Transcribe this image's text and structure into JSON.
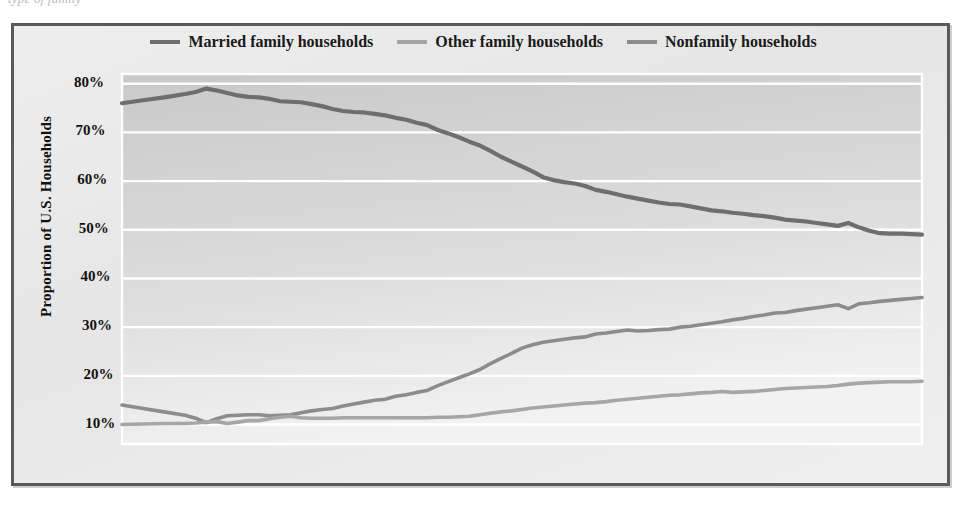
{
  "caption_remnant": "type of family",
  "figure": {
    "plot_bg_light": "#e9e9e9",
    "plot_bg_dark": "#c9c9c9",
    "gridline_color": "#ffffff",
    "frame_color": "#5a5a5a"
  },
  "legend": {
    "position": "top-center",
    "items": [
      {
        "label": "Married family households",
        "color": "#6e6e6e"
      },
      {
        "label": "Other family households",
        "color": "#a6a6a6"
      },
      {
        "label": "Nonfamily households",
        "color": "#8c8c8c"
      }
    ]
  },
  "axes": {
    "ylabel": "Proportion of U.S. Households",
    "xlabel": "",
    "yticks": [
      "10%",
      "20%",
      "30%",
      "40%",
      "50%",
      "60%",
      "70%",
      "80%"
    ],
    "xticks": [
      "1940",
      "1950",
      "1960",
      "1970",
      "1980",
      "1990",
      "2000",
      "2010"
    ]
  },
  "chart_data": {
    "type": "line",
    "title": "",
    "xlabel": "",
    "ylabel": "Proportion of U.S. Households",
    "xlim": [
      1940,
      2016
    ],
    "ylim": [
      6,
      82
    ],
    "grid": "horizontal",
    "legend_position": "top-center",
    "x": [
      1940,
      1942,
      1944,
      1946,
      1947,
      1948,
      1949,
      1950,
      1951,
      1952,
      1953,
      1954,
      1955,
      1956,
      1957,
      1958,
      1959,
      1960,
      1961,
      1962,
      1963,
      1964,
      1965,
      1966,
      1967,
      1968,
      1969,
      1970,
      1971,
      1972,
      1973,
      1974,
      1975,
      1976,
      1977,
      1978,
      1979,
      1980,
      1981,
      1982,
      1983,
      1984,
      1985,
      1986,
      1987,
      1988,
      1989,
      1990,
      1991,
      1992,
      1993,
      1994,
      1995,
      1996,
      1997,
      1998,
      1999,
      2000,
      2001,
      2002,
      2003,
      2004,
      2005,
      2006,
      2007,
      2008,
      2009,
      2010,
      2011,
      2012,
      2013,
      2014,
      2015,
      2016
    ],
    "series": [
      {
        "name": "Married family households",
        "color": "#6e6e6e",
        "values": [
          76.0,
          76.6,
          77.2,
          77.9,
          78.3,
          79.0,
          78.6,
          78.1,
          77.6,
          77.3,
          77.2,
          76.9,
          76.4,
          76.3,
          76.2,
          75.8,
          75.4,
          74.8,
          74.4,
          74.2,
          74.1,
          73.8,
          73.5,
          73.0,
          72.6,
          72.0,
          71.5,
          70.5,
          69.8,
          69.0,
          68.1,
          67.3,
          66.2,
          65.0,
          64.0,
          63.0,
          62.0,
          60.8,
          60.2,
          59.8,
          59.5,
          59.0,
          58.2,
          57.8,
          57.3,
          56.8,
          56.4,
          56.0,
          55.6,
          55.3,
          55.2,
          54.8,
          54.4,
          54.0,
          53.8,
          53.5,
          53.3,
          53.0,
          52.8,
          52.5,
          52.1,
          51.9,
          51.7,
          51.4,
          51.1,
          50.8,
          51.4,
          50.5,
          49.8,
          49.3,
          49.2,
          49.2,
          49.1,
          49.0
        ]
      },
      {
        "name": "Nonfamily households",
        "color": "#8c8c8c",
        "values": [
          14.0,
          13.3,
          12.6,
          11.9,
          11.3,
          10.4,
          11.2,
          11.8,
          11.9,
          12.0,
          12.0,
          11.8,
          11.9,
          12.0,
          12.4,
          12.8,
          13.1,
          13.3,
          13.8,
          14.2,
          14.6,
          15.0,
          15.2,
          15.8,
          16.1,
          16.6,
          17.0,
          18.0,
          18.8,
          19.6,
          20.4,
          21.3,
          22.5,
          23.6,
          24.6,
          25.7,
          26.4,
          26.9,
          27.2,
          27.5,
          27.8,
          28.0,
          28.6,
          28.8,
          29.1,
          29.4,
          29.2,
          29.3,
          29.5,
          29.6,
          30.0,
          30.2,
          30.5,
          30.8,
          31.1,
          31.5,
          31.8,
          32.2,
          32.5,
          32.9,
          33.0,
          33.4,
          33.7,
          34.0,
          34.3,
          34.6,
          33.8,
          34.8,
          35.0,
          35.3,
          35.5,
          35.7,
          35.9,
          36.1
        ]
      },
      {
        "name": "Other family households",
        "color": "#a6a6a6",
        "values": [
          10.0,
          10.1,
          10.2,
          10.2,
          10.3,
          10.5,
          10.6,
          10.2,
          10.5,
          10.8,
          10.8,
          11.2,
          11.5,
          11.7,
          11.4,
          11.3,
          11.3,
          11.3,
          11.4,
          11.4,
          11.4,
          11.4,
          11.4,
          11.4,
          11.4,
          11.4,
          11.4,
          11.5,
          11.5,
          11.6,
          11.7,
          12.0,
          12.3,
          12.6,
          12.8,
          13.1,
          13.4,
          13.6,
          13.8,
          14.0,
          14.2,
          14.4,
          14.5,
          14.7,
          15.0,
          15.2,
          15.4,
          15.6,
          15.8,
          16.0,
          16.1,
          16.3,
          16.5,
          16.6,
          16.8,
          16.6,
          16.7,
          16.8,
          17.0,
          17.2,
          17.4,
          17.5,
          17.6,
          17.7,
          17.8,
          18.0,
          18.3,
          18.5,
          18.6,
          18.7,
          18.8,
          18.8,
          18.8,
          18.9
        ]
      }
    ]
  }
}
